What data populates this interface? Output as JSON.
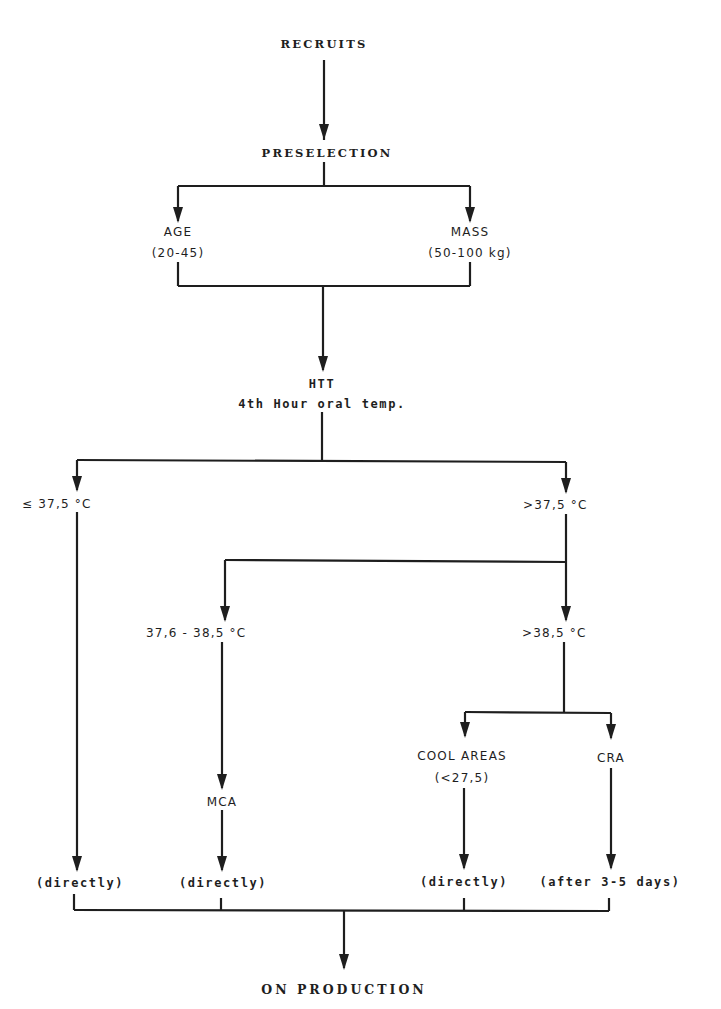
{
  "diagram": {
    "type": "flowchart",
    "nodes": {
      "recruits": "RECRUITS",
      "preselection": "PRESELECTION",
      "age": "AGE",
      "age_range": "(20-45)",
      "mass": "MASS",
      "mass_range": "(50-100 kg)",
      "htt": "HTT",
      "htt_sub": "4th Hour oral temp.",
      "le_375": "≤ 37,5 °C",
      "gt_375": ">37,5 °C",
      "range_376_385": "37,6 - 38,5 °C",
      "gt_385": ">38,5 °C",
      "cool_areas": "COOL AREAS",
      "cool_areas_sub": "(<27,5)",
      "cra": "CRA",
      "mca": "MCA",
      "directly_1": "(directly)",
      "directly_2": "(directly)",
      "directly_3": "(directly)",
      "after_days": "(after 3-5 days)",
      "on_production": "ON PRODUCTION"
    },
    "line_color": "#1e1e1e",
    "background": "#ffffff"
  }
}
